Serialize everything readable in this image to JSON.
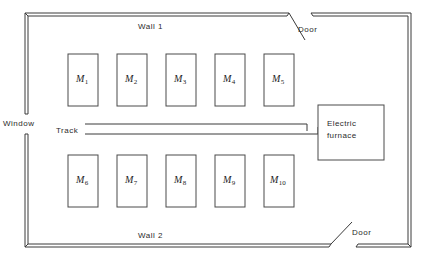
{
  "diagram": {
    "walls": [
      {
        "id": "wall-1",
        "label": "Wall 1",
        "x": 138,
        "y": 22
      },
      {
        "id": "wall-2",
        "label": "Wall 2",
        "x": 138,
        "y": 231
      }
    ],
    "openings": [
      {
        "id": "window",
        "label": "Window",
        "x": 3,
        "y": 119
      },
      {
        "id": "door-top",
        "label": "Door",
        "x": 298,
        "y": 25
      },
      {
        "id": "door-bottom",
        "label": "Door",
        "x": 352,
        "y": 228
      }
    ],
    "track": {
      "label": "Track",
      "label_x": 56,
      "label_y": 126
    },
    "furnace": {
      "id": "electric-furnace",
      "line1": "Electric",
      "line2": "furnace",
      "x": 318,
      "y": 105,
      "width": 66,
      "height": 55
    },
    "machines": [
      {
        "id": "M1",
        "name": "M",
        "index": "1",
        "x": 68,
        "y": 54
      },
      {
        "id": "M2",
        "name": "M",
        "index": "2",
        "x": 117,
        "y": 54
      },
      {
        "id": "M3",
        "name": "M",
        "index": "3",
        "x": 166,
        "y": 54
      },
      {
        "id": "M4",
        "name": "M",
        "index": "4",
        "x": 215,
        "y": 54
      },
      {
        "id": "M5",
        "name": "M",
        "index": "5",
        "x": 264,
        "y": 54
      },
      {
        "id": "M6",
        "name": "M",
        "index": "6",
        "x": 68,
        "y": 155
      },
      {
        "id": "M7",
        "name": "M",
        "index": "7",
        "x": 117,
        "y": 155
      },
      {
        "id": "M8",
        "name": "M",
        "index": "8",
        "x": 166,
        "y": 155
      },
      {
        "id": "M9",
        "name": "M",
        "index": "9",
        "x": 215,
        "y": 155
      },
      {
        "id": "M10",
        "name": "M",
        "index": "10",
        "x": 264,
        "y": 155
      }
    ],
    "machine_size": {
      "width": 30,
      "height": 52
    },
    "colors": {
      "stroke": "#3a3a3a",
      "text": "#2b2b2b",
      "background": "#ffffff"
    }
  }
}
